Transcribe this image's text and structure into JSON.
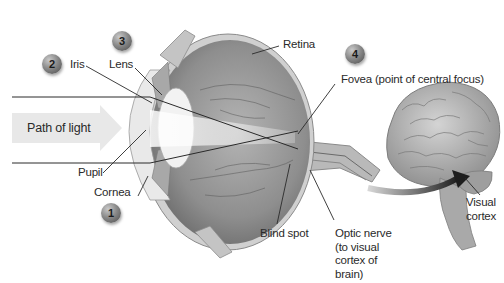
{
  "diagram": {
    "path_arrow_label": "Path of light",
    "labels": {
      "iris": "Iris",
      "lens": "Lens",
      "retina": "Retina",
      "fovea": "Fovea (point of central focus)",
      "pupil": "Pupil",
      "cornea": "Cornea",
      "blind_spot": "Blind spot",
      "optic_nerve_line1": "Optic nerve",
      "optic_nerve_line2": "(to visual",
      "optic_nerve_line3": "cortex of",
      "optic_nerve_line4": "brain)",
      "visual_cortex_line1": "Visual",
      "visual_cortex_line2": "cortex"
    },
    "badges": [
      {
        "number": "1",
        "target": "Cornea"
      },
      {
        "number": "2",
        "target": "Iris"
      },
      {
        "number": "3",
        "target": "Lens"
      },
      {
        "number": "4",
        "target": "Fovea"
      }
    ],
    "colors": {
      "background": "#ffffff",
      "eye_fill": "#9a9a9a",
      "sclera": "#c8c8c8",
      "arrow": "#e6e6e6",
      "brain": "#b5b5b5",
      "leader_line": "#2a2a2a"
    }
  }
}
